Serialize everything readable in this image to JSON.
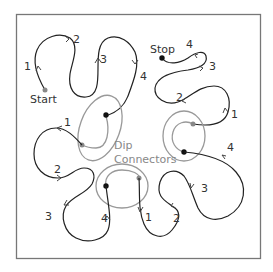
{
  "diagram": {
    "labels": {
      "start": "Start",
      "stop": "Stop",
      "dip_line1": "Dip",
      "dip_line2": "Connectors"
    },
    "segments": {
      "tl": [
        "1",
        "2",
        "3",
        "4"
      ],
      "tr": [
        "1",
        "2",
        "3",
        "4"
      ],
      "bl": [
        "1",
        "2",
        "3",
        "4"
      ],
      "br": [
        "1",
        "2",
        "3",
        "4"
      ]
    },
    "colors": {
      "frame": "#777777",
      "path": "#222222",
      "connector": "#999999",
      "connector_label": "#888888",
      "dot_black": "#111111",
      "dot_gray": "#888888"
    }
  }
}
